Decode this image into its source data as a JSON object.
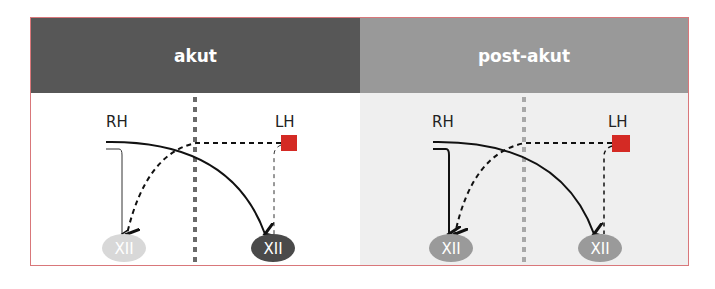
{
  "panels": [
    {
      "title": "akut",
      "left_label": "RH",
      "right_label": "LH",
      "left_node": "XII",
      "right_node": "XII",
      "left_node_color": "#d8d8d8",
      "right_node_color": "#4a4a4a",
      "midline_color": "#6a6a6a"
    },
    {
      "title": "post-akut",
      "left_label": "RH",
      "right_label": "LH",
      "left_node": "XII",
      "right_node": "XII",
      "left_node_color": "#9a9a9a",
      "right_node_color": "#9a9a9a",
      "midline_color": "#a8a8a8"
    }
  ],
  "colors": {
    "lesion": "#d42a24",
    "frame": "#d9777a"
  }
}
